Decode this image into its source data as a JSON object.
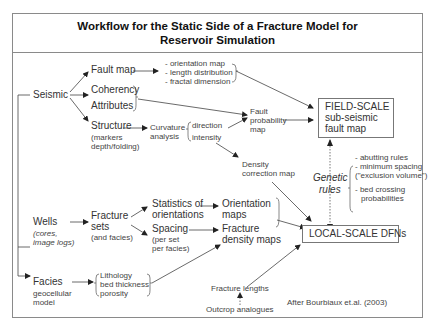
{
  "title": {
    "line1": "Workflow for the Static Side of a Fracture Model for",
    "line2": "Reservoir Simulation"
  },
  "sources": {
    "seismic": "Seismic",
    "wells": "Wells",
    "wells_sub1": "(cores,",
    "wells_sub2": "image logs)",
    "facies": "Facies",
    "facies_sub1": "geocellular",
    "facies_sub2": "model",
    "outcrop": "Outcrop analogues"
  },
  "seismic_branch": {
    "fault_map": "Fault map",
    "fault_map_outputs": [
      "- orientation map",
      "- length distribution",
      "- fractal dimension"
    ],
    "coherency": "Coherency",
    "attributes": "Attributes",
    "structure": "Structure",
    "structure_sub1": "(markers",
    "structure_sub2": "depth/folding)",
    "curvature1": "Curvature",
    "curvature2": "analysis",
    "direction": "direction",
    "intensity": "intensity",
    "fault_prob1": "Fault",
    "fault_prob2": "probability",
    "fault_prob3": "map",
    "density_corr1": "Density",
    "density_corr2": "correction map"
  },
  "wells_branch": {
    "fracture_sets1": "Fracture",
    "fracture_sets2": "sets",
    "fracture_sets3": "(and facies)",
    "stats1": "Statistics of",
    "stats2": "orientations",
    "spacing1": "Spacing",
    "spacing2": "(per set",
    "spacing3": "per facies)",
    "orient_maps1": "Orientation",
    "orient_maps2": "maps",
    "density_maps1": "Fracture",
    "density_maps2": "density maps"
  },
  "facies_branch": {
    "props": [
      "Lithology",
      "bed thickness",
      "porosity"
    ]
  },
  "outputs": {
    "field_scale1": "FIELD-SCALE",
    "field_scale2": "sub-seismic",
    "field_scale3": "fault map",
    "local_scale": "LOCAL-SCALE DFNs",
    "fracture_lengths": "Fracture lengths"
  },
  "genetic_rules": {
    "label1": "Genetic",
    "label2": "rules",
    "items": [
      "- abutting rules",
      "- minimum spacing",
      "(\"exclusion volume\")",
      "- bed crossing",
      "probabilities"
    ]
  },
  "citation": "After Bourbiaux et.al. (2003)"
}
